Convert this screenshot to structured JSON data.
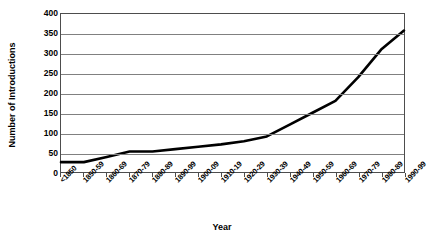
{
  "chart_data": {
    "type": "line",
    "title": "",
    "xlabel": "Year",
    "ylabel": "Number of Introductions",
    "categories": [
      "<1850",
      "1850-59",
      "1860-69",
      "1870-79",
      "1880-89",
      "1890-99",
      "1900-09",
      "1910-19",
      "1920-29",
      "1930-39",
      "1940-49",
      "1950-59",
      "1960-69",
      "1970-79",
      "1980-89",
      "1990-99"
    ],
    "values": [
      25,
      25,
      38,
      52,
      52,
      58,
      64,
      70,
      78,
      90,
      120,
      150,
      180,
      240,
      310,
      358
    ],
    "ylim": [
      0,
      400
    ],
    "yticks": [
      0,
      50,
      100,
      150,
      200,
      250,
      300,
      350,
      400
    ],
    "ytick_labels": [
      "0",
      "50",
      "100",
      "150",
      "200",
      "250",
      "300",
      "350",
      "400"
    ],
    "grid": true,
    "legend": false,
    "legend_position": "none",
    "series_color": "#000000",
    "grid_color": "#808080",
    "axis_color": "#4d4d4d",
    "background": "#ffffff"
  }
}
